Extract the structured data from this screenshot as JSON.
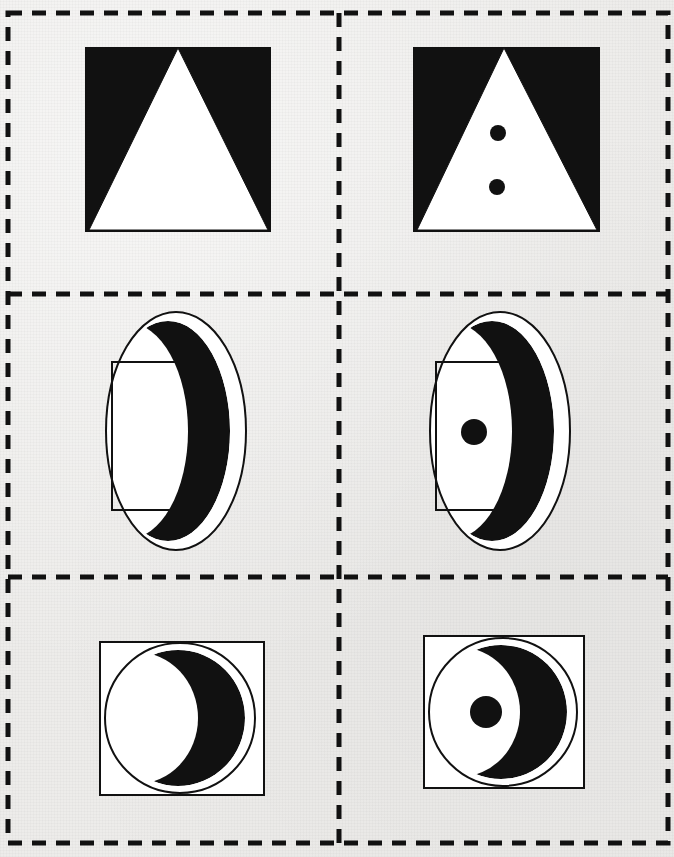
{
  "page": {
    "kind": "figure-matrix-worksheet",
    "width": 674,
    "height": 857,
    "background_color": "#edecea",
    "ink_color": "#101010",
    "fill_white": "#ffffff",
    "title": ""
  },
  "grid": {
    "columns": 2,
    "rows": 3,
    "border_style": "dashed",
    "border_color": "#111111",
    "border_width": 5,
    "dash_pattern": "14 10",
    "outer": {
      "x": 8,
      "y": 13,
      "width": 660,
      "height": 830
    },
    "divider_vertical_x": [
      339
    ],
    "divider_horizontal_y": [
      294,
      577
    ]
  },
  "cells": [
    {
      "id": "cell-r1c1",
      "row": 1,
      "column": 1,
      "label": "black square with white triangle",
      "shapes": [
        {
          "name": "black-square",
          "type": "square",
          "fill": "#111111",
          "stroke": "none",
          "x": 85,
          "y": 47,
          "width": 186,
          "height": 185
        },
        {
          "name": "white-triangle",
          "type": "triangle",
          "fill": "#ffffff",
          "stroke": "#111111",
          "apex_x": 178,
          "apex_y": 48,
          "base_left_x": 89,
          "base_right_x": 268,
          "base_y": 230
        }
      ],
      "dots": []
    },
    {
      "id": "cell-r1c2",
      "row": 1,
      "column": 2,
      "label": "black square with white triangle and two dots",
      "shapes": [
        {
          "name": "black-square",
          "type": "square",
          "fill": "#111111",
          "stroke": "none",
          "x": 413,
          "y": 47,
          "width": 187,
          "height": 185
        },
        {
          "name": "white-triangle",
          "type": "triangle",
          "fill": "#ffffff",
          "stroke": "#111111",
          "apex_x": 504,
          "apex_y": 48,
          "base_left_x": 417,
          "base_right_x": 597,
          "base_y": 230
        }
      ],
      "dots": [
        {
          "name": "dot-upper",
          "cx": 498,
          "cy": 133,
          "r": 8,
          "fill": "#111111"
        },
        {
          "name": "dot-lower",
          "cx": 497,
          "cy": 187,
          "r": 8,
          "fill": "#111111"
        }
      ]
    },
    {
      "id": "cell-r2c1",
      "row": 2,
      "column": 1,
      "label": "ellipse with crescent and rectangle",
      "shapes": [
        {
          "name": "outline-ellipse",
          "type": "ellipse",
          "fill": "#ffffff",
          "stroke": "#111111",
          "cx": 176,
          "cy": 431,
          "rx": 70,
          "ry": 119
        },
        {
          "name": "black-crescent",
          "type": "crescent",
          "fill": "#111111",
          "stroke": "none",
          "cx": 168,
          "cy": 431,
          "rx": 62,
          "ry": 110,
          "cut_dx": -40,
          "cut_rx": 60,
          "cut_ry": 108
        },
        {
          "name": "outline-rectangle",
          "type": "rect",
          "fill": "none",
          "stroke": "#111111",
          "x": 112,
          "y": 362,
          "width": 85,
          "height": 148
        }
      ],
      "dots": []
    },
    {
      "id": "cell-r2c2",
      "row": 2,
      "column": 2,
      "label": "ellipse with crescent, rectangle and one dot",
      "shapes": [
        {
          "name": "outline-ellipse",
          "type": "ellipse",
          "fill": "#ffffff",
          "stroke": "#111111",
          "cx": 500,
          "cy": 431,
          "rx": 70,
          "ry": 119
        },
        {
          "name": "black-crescent",
          "type": "crescent",
          "fill": "#111111",
          "stroke": "none",
          "cx": 492,
          "cy": 431,
          "rx": 62,
          "ry": 110,
          "cut_dx": -40,
          "cut_rx": 60,
          "cut_ry": 108
        },
        {
          "name": "outline-rectangle",
          "type": "rect",
          "fill": "none",
          "stroke": "#111111",
          "x": 436,
          "y": 362,
          "width": 85,
          "height": 148
        }
      ],
      "dots": [
        {
          "name": "dot-center",
          "cx": 474,
          "cy": 432,
          "r": 13,
          "fill": "#111111"
        }
      ]
    },
    {
      "id": "cell-r3c1",
      "row": 3,
      "column": 1,
      "label": "square with circle and crescent",
      "shapes": [
        {
          "name": "outline-square",
          "type": "rect",
          "fill": "#ffffff",
          "stroke": "#111111",
          "x": 100,
          "y": 642,
          "width": 164,
          "height": 153
        },
        {
          "name": "outline-circle",
          "type": "ellipse",
          "fill": "#ffffff",
          "stroke": "#111111",
          "cx": 180,
          "cy": 718,
          "rx": 75,
          "ry": 75
        },
        {
          "name": "black-crescent",
          "type": "crescent",
          "fill": "#111111",
          "stroke": "none",
          "cx": 178,
          "cy": 718,
          "rx": 67,
          "ry": 68,
          "cut_dx": -42,
          "cut_rx": 62,
          "cut_ry": 66
        }
      ],
      "dots": []
    },
    {
      "id": "cell-r3c2",
      "row": 3,
      "column": 2,
      "label": "square with circle, crescent and one dot",
      "shapes": [
        {
          "name": "outline-square",
          "type": "rect",
          "fill": "#ffffff",
          "stroke": "#111111",
          "x": 424,
          "y": 636,
          "width": 160,
          "height": 152
        },
        {
          "name": "outline-circle",
          "type": "ellipse",
          "fill": "#ffffff",
          "stroke": "#111111",
          "cx": 503,
          "cy": 712,
          "rx": 74,
          "ry": 74
        },
        {
          "name": "black-crescent",
          "type": "crescent",
          "fill": "#111111",
          "stroke": "none",
          "cx": 501,
          "cy": 712,
          "rx": 66,
          "ry": 67,
          "cut_dx": -42,
          "cut_rx": 61,
          "cut_ry": 65
        }
      ],
      "dots": [
        {
          "name": "dot-center",
          "cx": 486,
          "cy": 712,
          "r": 16,
          "fill": "#111111"
        }
      ]
    }
  ]
}
